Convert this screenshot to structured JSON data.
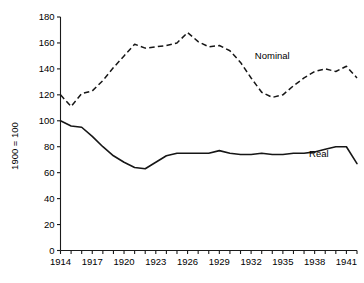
{
  "chart_data": {
    "type": "line",
    "title": "",
    "xlabel": "",
    "ylabel": "1900 = 100",
    "xlim": [
      1914,
      1942
    ],
    "ylim": [
      0,
      180
    ],
    "yticks": [
      0,
      20,
      40,
      60,
      80,
      100,
      120,
      140,
      160,
      180
    ],
    "xticks_labeled": [
      1914,
      1917,
      1920,
      1923,
      1926,
      1929,
      1932,
      1935,
      1938,
      1941
    ],
    "xtick_step_minor": 1,
    "grid": false,
    "legend_position": "inline-annotation",
    "x": [
      1914,
      1915,
      1916,
      1917,
      1918,
      1919,
      1920,
      1921,
      1922,
      1923,
      1924,
      1925,
      1926,
      1927,
      1928,
      1929,
      1930,
      1931,
      1932,
      1933,
      1934,
      1935,
      1936,
      1937,
      1938,
      1939,
      1940,
      1941,
      1942
    ],
    "series": [
      {
        "name": "Nominal",
        "style": "dashed",
        "values": [
          120,
          111,
          121,
          123,
          131,
          141,
          150,
          159,
          156,
          157,
          158,
          160,
          168,
          161,
          157,
          158,
          154,
          145,
          133,
          122,
          118,
          120,
          127,
          133,
          138,
          140,
          138,
          142,
          133
        ]
      },
      {
        "name": "Real",
        "style": "solid",
        "values": [
          100,
          96,
          95,
          88,
          80,
          73,
          68,
          64,
          63,
          68,
          73,
          75,
          75,
          75,
          75,
          77,
          75,
          74,
          74,
          75,
          74,
          74,
          75,
          75,
          76,
          78,
          80,
          80,
          67
        ]
      }
    ],
    "annotations": [
      {
        "text": "Nominal",
        "x": 1934.0,
        "y": 148
      },
      {
        "text": "Real",
        "x": 1938.4,
        "y": 72
      }
    ]
  },
  "axis_labels": {
    "y_axis_title": "1900 = 100",
    "y_tick_labels": [
      "0",
      "20",
      "40",
      "60",
      "80",
      "100",
      "120",
      "140",
      "160",
      "180"
    ],
    "x_tick_labels": [
      "1914",
      "1917",
      "1920",
      "1923",
      "1926",
      "1929",
      "1932",
      "1935",
      "1938",
      "1941"
    ]
  },
  "colors": {
    "line": "#161616",
    "axis": "#1a1a1a",
    "background": "#ffffff"
  }
}
